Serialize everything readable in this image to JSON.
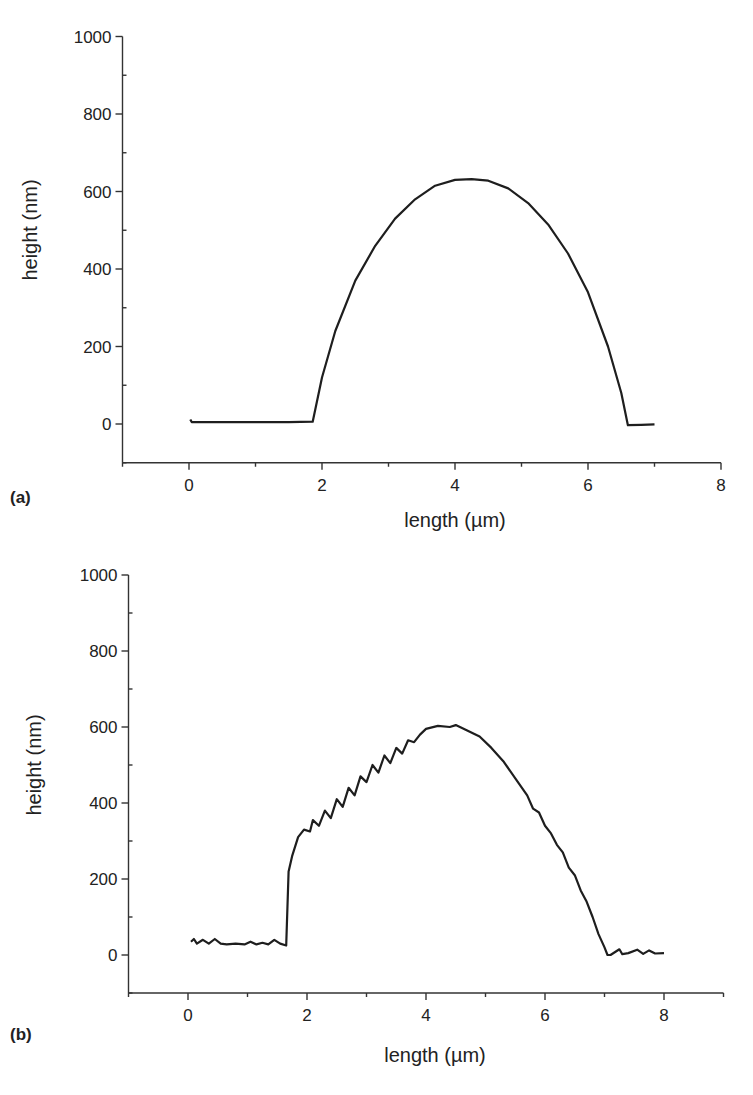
{
  "chart_data": [
    {
      "panel": "(a)",
      "type": "line",
      "title": "",
      "xlabel": "length (µm)",
      "ylabel": "height (nm)",
      "xlim": [
        -1,
        8
      ],
      "ylim": [
        -100,
        1000
      ],
      "xticks": [
        0,
        2,
        4,
        6,
        8
      ],
      "yticks": [
        0,
        200,
        400,
        600,
        800,
        1000
      ],
      "grid": false,
      "legend": null,
      "series": [
        {
          "name": "profile (a)",
          "x": [
            0.02,
            0.04,
            0.5,
            1.0,
            1.5,
            1.86,
            2.0,
            2.2,
            2.5,
            2.8,
            3.1,
            3.4,
            3.7,
            4.0,
            4.25,
            4.5,
            4.8,
            5.1,
            5.4,
            5.7,
            6.0,
            6.3,
            6.5,
            6.6,
            6.8,
            7.0
          ],
          "y": [
            12,
            5,
            5,
            5,
            5,
            6,
            120,
            240,
            370,
            460,
            530,
            580,
            615,
            630,
            632,
            628,
            608,
            570,
            515,
            440,
            340,
            200,
            80,
            -3,
            -2,
            -1
          ]
        }
      ]
    },
    {
      "panel": "(b)",
      "type": "line",
      "title": "",
      "xlabel": "length (µm)",
      "ylabel": "height (nm)",
      "xlim": [
        -1,
        9
      ],
      "ylim": [
        -100,
        1000
      ],
      "xticks": [
        0,
        2,
        4,
        6,
        8
      ],
      "yticks": [
        0,
        200,
        400,
        600,
        800,
        1000
      ],
      "grid": false,
      "legend": null,
      "series": [
        {
          "name": "profile (b)",
          "x": [
            0.05,
            0.1,
            0.15,
            0.25,
            0.35,
            0.45,
            0.55,
            0.65,
            0.8,
            0.95,
            1.05,
            1.15,
            1.25,
            1.35,
            1.45,
            1.55,
            1.65,
            1.69,
            1.75,
            1.85,
            1.95,
            2.05,
            2.1,
            2.2,
            2.3,
            2.4,
            2.5,
            2.6,
            2.7,
            2.8,
            2.9,
            3.0,
            3.1,
            3.2,
            3.3,
            3.4,
            3.5,
            3.6,
            3.7,
            3.8,
            3.9,
            4.0,
            4.2,
            4.4,
            4.5,
            4.7,
            4.9,
            5.1,
            5.3,
            5.5,
            5.7,
            5.8,
            5.9,
            6.0,
            6.1,
            6.2,
            6.3,
            6.4,
            6.5,
            6.6,
            6.7,
            6.8,
            6.9,
            7.0,
            7.05,
            7.1,
            7.25,
            7.3,
            7.4,
            7.55,
            7.65,
            7.75,
            7.85,
            8.0
          ],
          "y": [
            35,
            42,
            30,
            40,
            30,
            42,
            30,
            28,
            30,
            28,
            35,
            28,
            32,
            28,
            40,
            30,
            25,
            220,
            260,
            310,
            330,
            325,
            355,
            340,
            380,
            360,
            410,
            390,
            440,
            420,
            470,
            455,
            500,
            480,
            525,
            505,
            545,
            530,
            565,
            560,
            580,
            595,
            603,
            600,
            605,
            590,
            575,
            545,
            510,
            465,
            420,
            385,
            375,
            340,
            320,
            290,
            270,
            230,
            210,
            170,
            140,
            100,
            55,
            20,
            0,
            0,
            15,
            2,
            5,
            14,
            3,
            12,
            4,
            5
          ]
        }
      ]
    }
  ],
  "panels": {
    "a": {
      "label": "(a)",
      "xlabel": "length (µm)",
      "ylabel": "height (nm)",
      "ytick_labels": [
        "1000",
        "800",
        "600",
        "400",
        "200",
        "0"
      ],
      "xtick_labels": [
        "0",
        "2",
        "4",
        "6",
        "8"
      ]
    },
    "b": {
      "label": "(b)",
      "xlabel": "length (µm)",
      "ylabel": "height (nm)",
      "ytick_labels": [
        "1000",
        "800",
        "600",
        "400",
        "200",
        "0"
      ],
      "xtick_labels": [
        "0",
        "2",
        "4",
        "6",
        "8"
      ]
    }
  },
  "colors": {
    "line": "#1e1e1e",
    "axis": "#333333",
    "background": "#ffffff"
  }
}
